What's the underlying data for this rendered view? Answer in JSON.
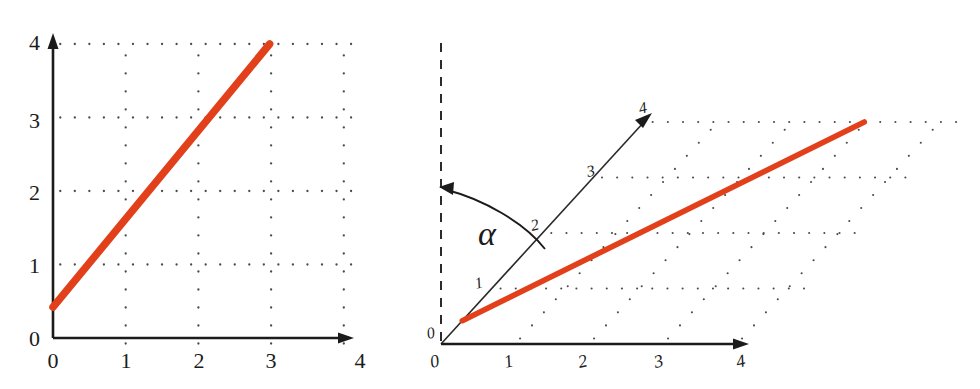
{
  "figure": {
    "background_color": "#ffffff",
    "accent_color": "#e2401b",
    "axis_color": "#1b1b1b",
    "grid_dot_color": "#4a4a4a",
    "panel_count": 2
  },
  "panels": [
    {
      "id": "cartesian",
      "name": "rectangular-cartesian-plot",
      "x_axis": {
        "label": "",
        "ticks": [
          "0",
          "1",
          "2",
          "3",
          "4"
        ],
        "arrow": true
      },
      "y_axis": {
        "label": "",
        "ticks": [
          "0",
          "1",
          "2",
          "3",
          "4"
        ],
        "arrow": true
      },
      "dashed_vertical": false,
      "angle_label": ""
    },
    {
      "id": "oblique",
      "name": "oblique-skewed-axes-plot",
      "x_axis": {
        "label": "",
        "ticks": [
          "0",
          "1",
          "2",
          "3",
          "4"
        ],
        "arrow": true
      },
      "y_axis": {
        "label": "",
        "ticks": [
          "0",
          "1",
          "2",
          "3",
          "4"
        ],
        "arrow": true
      },
      "dashed_vertical": true,
      "angle_label": "α"
    }
  ],
  "chart_data": [
    {
      "type": "line",
      "id": "cartesian",
      "title": "",
      "xlabel": "",
      "ylabel": "",
      "xlim": [
        0,
        4
      ],
      "ylim": [
        0,
        4
      ],
      "xticks": [
        0,
        1,
        2,
        3,
        4
      ],
      "yticks": [
        0,
        1,
        2,
        3,
        4
      ],
      "xticklabels": [
        "0",
        "1",
        "2",
        "3",
        "4"
      ],
      "yticklabels": [
        "0",
        "1",
        "2",
        "3",
        "4"
      ],
      "grid": "dotted",
      "grid_style": "rectangular",
      "legend": "none",
      "axes_orthogonal": true,
      "series": [
        {
          "name": "line-segment",
          "color": "#e2401b",
          "linewidth": 7.5,
          "x": [
            0.0,
            2.98
          ],
          "y": [
            0.42,
            4.0
          ],
          "slope": 1.2,
          "intercept": 0.42
        }
      ]
    },
    {
      "type": "line",
      "id": "oblique",
      "title": "",
      "xlabel": "",
      "ylabel": "",
      "xlim": [
        0,
        4
      ],
      "ylim": [
        0,
        4
      ],
      "xticks": [
        0,
        1,
        2,
        3,
        4
      ],
      "yticks": [
        0,
        1,
        2,
        3,
        4
      ],
      "xticklabels": [
        "0",
        "1",
        "2",
        "3",
        "4"
      ],
      "yticklabels": [
        "0",
        "1",
        "2",
        "3",
        "4"
      ],
      "grid": "dotted",
      "grid_style": "oblique-parallelogram",
      "legend": "none",
      "axes_orthogonal": false,
      "y_axis_angle_from_vertical_deg": 38,
      "angle_annotation": {
        "symbol": "α",
        "from": "dashed-vertical-reference",
        "to": "y-axis",
        "arrow_at": "dashed-vertical-reference"
      },
      "series": [
        {
          "name": "line-segment",
          "color": "#e2401b",
          "linewidth": 5.6,
          "x": [
            0.0,
            2.98
          ],
          "y": [
            0.42,
            4.0
          ],
          "slope": 1.2,
          "intercept": 0.42
        }
      ]
    }
  ]
}
